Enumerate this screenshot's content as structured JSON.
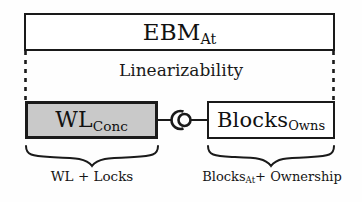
{
  "diagram": {
    "title_box": {
      "name": "EBM",
      "subscript": "At",
      "full_text": "EBM_At"
    },
    "relation_label": "Linearizability",
    "left_component": {
      "name": "WL",
      "subscript": "Conc",
      "full_text": "WL_Conc",
      "fill_color": "#c9c9c9"
    },
    "right_component": {
      "name": "Blocks",
      "subscript": "Owns",
      "full_text": "Blocks_Owns",
      "fill_color": "#ffffff"
    },
    "connector": {
      "kind": "ball-and-socket-interface"
    },
    "left_caption": {
      "text": "WL + Locks",
      "part_a": "WL",
      "operator": "+",
      "part_b": "Locks"
    },
    "right_caption": {
      "part_a": "Blocks",
      "part_a_subscript": "At",
      "operator": "+",
      "part_b": "Ownership",
      "text": "Blocks_At + Ownership"
    },
    "colors": {
      "stroke": "#1a1a1a",
      "background": "#fefefe",
      "shaded_fill": "#c9c9c9"
    }
  }
}
